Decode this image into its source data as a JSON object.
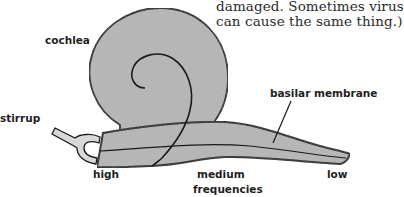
{
  "body_text": {
    "line1": "damaged. Sometimes virus",
    "line2": "can cause the same thing.)"
  },
  "figure": {
    "labels": {
      "cochlea": "cochlea",
      "stirrup": "stirrup",
      "basilar_membrane": "basilar membrane",
      "high": "high",
      "medium": "medium",
      "frequencies": "frequencies",
      "low": "low"
    },
    "colors": {
      "fill": "#b4b4b4",
      "stroke": "#1a1a1a",
      "stirrup_fill": "#d8d8d8"
    }
  }
}
